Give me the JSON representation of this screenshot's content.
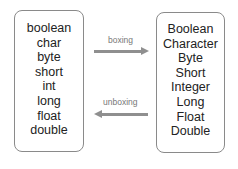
{
  "primitives": [
    "boolean",
    "char",
    "byte",
    "short",
    "int",
    "long",
    "float",
    "double"
  ],
  "wrappers": [
    "Boolean",
    "Character",
    "Byte",
    "Short",
    "Integer",
    "Long",
    "Float",
    "Double"
  ],
  "arrows": {
    "boxing_label": "boxing",
    "unboxing_label": "unboxing"
  },
  "colors": {
    "arrow": "#8f8f8f",
    "border": "#8a8a8a",
    "label": "#777777"
  }
}
